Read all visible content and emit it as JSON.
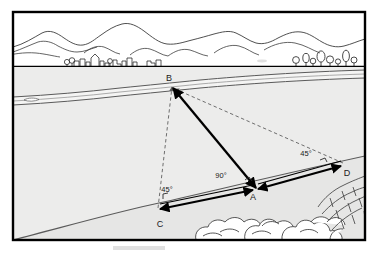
{
  "diagram": {
    "type": "survey-cross-section",
    "frame": {
      "border_color": "#000000",
      "background_color": "#ffffff"
    },
    "scene": {
      "sky_band_label": "distant mountain range with village and trees",
      "river_band_label": "river flowing across the valley",
      "ground_label": "sloping near bank with boulders and stone wall",
      "fill_color": "#e9e9e9",
      "line_color": "#555555"
    },
    "points": [
      {
        "id": "A",
        "label": "A",
        "x": 255,
        "y": 188,
        "label_x": 253,
        "label_y": 199,
        "role": "baseline-midpoint"
      },
      {
        "id": "B",
        "label": "B",
        "x": 172,
        "y": 87,
        "label_x": 169,
        "label_y": 81,
        "role": "target-across-river"
      },
      {
        "id": "C",
        "label": "C",
        "x": 158,
        "y": 208,
        "label_x": 159,
        "label_y": 226,
        "role": "baseline-left-end"
      },
      {
        "id": "D",
        "label": "D",
        "x": 343,
        "y": 163,
        "label_x": 346,
        "label_y": 175,
        "role": "baseline-right-end"
      }
    ],
    "angles": [
      {
        "id": "angle-at-c",
        "value": "45°",
        "label_x": 167,
        "label_y": 191,
        "vertex": "C"
      },
      {
        "id": "angle-at-a",
        "value": "90°",
        "label_x": 221,
        "label_y": 177,
        "vertex": "A"
      },
      {
        "id": "angle-at-d",
        "value": "45°",
        "label_x": 306,
        "label_y": 155,
        "vertex": "D"
      }
    ],
    "lines": [
      {
        "id": "ba-solid",
        "from": "B",
        "to": "A",
        "style": "solid",
        "arrows": "both",
        "color": "#000000"
      },
      {
        "id": "cb-dashed",
        "from": "C",
        "to": "B",
        "style": "dashed",
        "arrows": "end",
        "color": "#777777"
      },
      {
        "id": "db-dashed",
        "from": "D",
        "to": "B",
        "style": "dashed",
        "arrows": "end",
        "color": "#777777"
      },
      {
        "id": "ca-baseline",
        "from": "C",
        "to": "A",
        "style": "solid",
        "arrows": "both",
        "color": "#000000"
      },
      {
        "id": "ad-baseline",
        "from": "A",
        "to": "D",
        "style": "solid",
        "arrows": "both",
        "color": "#000000"
      }
    ]
  }
}
